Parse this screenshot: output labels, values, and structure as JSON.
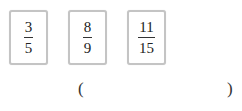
{
  "cards": [
    {
      "numerator": "3",
      "denominator": "5"
    },
    {
      "numerator": "8",
      "denominator": "9"
    },
    {
      "numerator": "11",
      "denominator": "15"
    }
  ],
  "answer": {
    "open_paren": "(",
    "close_paren": ")",
    "value": ""
  }
}
